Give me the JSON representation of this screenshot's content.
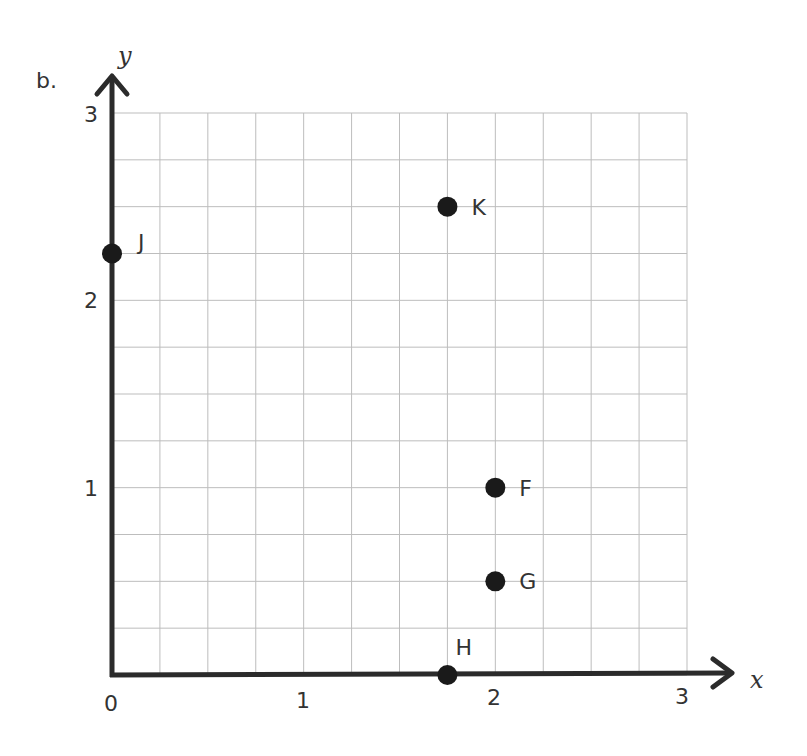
{
  "part_label": "b.",
  "chart_data": {
    "type": "scatter",
    "title": "",
    "xlabel": "x",
    "ylabel": "y",
    "xlim": [
      0,
      3
    ],
    "ylim": [
      0,
      3
    ],
    "xticks": [
      "0",
      "1",
      "2",
      "3"
    ],
    "yticks": [
      "1",
      "2",
      "3"
    ],
    "grid": {
      "on": true,
      "minor_step": 0.25
    },
    "legend": null,
    "points": [
      {
        "label": "K",
        "x": 1.75,
        "y": 2.5
      },
      {
        "label": "J",
        "x": 0,
        "y": 2.25
      },
      {
        "label": "F",
        "x": 2,
        "y": 1
      },
      {
        "label": "G",
        "x": 2,
        "y": 0.5
      },
      {
        "label": "H",
        "x": 1.75,
        "y": 0
      }
    ]
  },
  "colors": {
    "axis": "#2b2b2b",
    "grid": "#bdbdbd",
    "point": "#1a1a1a",
    "text": "#333333"
  }
}
